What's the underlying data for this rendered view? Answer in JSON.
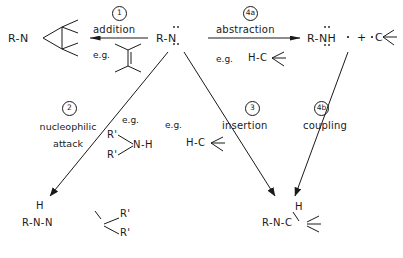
{
  "diagram": {
    "center_species": {
      "label": "R-N",
      "name": "aminyl-radical"
    },
    "products": {
      "left": {
        "label": "R-N",
        "name": "aziridine-adduct"
      },
      "right_main": {
        "label": "R-NH",
        "name": "amine-product"
      },
      "right_plus": {
        "label": "+",
        "name": "plus-sign"
      },
      "right_radical": {
        "label": "C",
        "name": "carbon-radical"
      },
      "bottom_left": {
        "r": "R",
        "n1": "N",
        "h": "H",
        "n2": "N",
        "r_prime": "R'",
        "r_dprime": "R'",
        "name": "hydrazine-product"
      },
      "bottom_right": {
        "r": "R",
        "n": "N",
        "h": "H",
        "c": "C",
        "name": "insertion-product"
      }
    },
    "pathways": [
      {
        "number": "1",
        "name": "addition",
        "label": "addition",
        "eg_label": "e.g.",
        "eg_formula": "alkene",
        "direction": "left"
      },
      {
        "number": "4a",
        "name": "abstraction",
        "label": "abstraction",
        "eg_label": "e.g.",
        "eg_formula": "H-C",
        "direction": "right"
      },
      {
        "number": "2",
        "name": "nucleophilic-attack",
        "label": "nucleophilic\nattack",
        "line1": "nucleophilic",
        "line2": "attack",
        "eg_label": "e.g.",
        "eg_formula": "R'R'N-H",
        "direction": "down-left"
      },
      {
        "number": "3",
        "name": "insertion",
        "label": "insertion",
        "eg_label": "e.g.",
        "eg_formula": "H-C",
        "direction": "down-right"
      },
      {
        "number": "4b",
        "name": "coupling",
        "label": "coupling",
        "eg_label": "",
        "eg_formula": "",
        "direction": "down-left-from-right"
      }
    ],
    "atoms": {
      "H": "H",
      "N": "N",
      "C": "C",
      "R": "R",
      "R_prime": "R'"
    },
    "colors": {
      "ink": "#1a1a1a",
      "background": "#ffffff"
    }
  }
}
